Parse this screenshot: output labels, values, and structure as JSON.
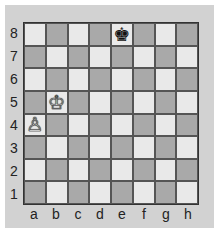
{
  "board": {
    "ranks": [
      "8",
      "7",
      "6",
      "5",
      "4",
      "3",
      "2",
      "1"
    ],
    "files": [
      "a",
      "b",
      "c",
      "d",
      "e",
      "f",
      "g",
      "h"
    ],
    "colors": {
      "light": "#e9e9e9",
      "dark": "#a9a9a9",
      "frame": "#d2d2d2"
    },
    "pieces": [
      {
        "square": "e8",
        "type": "king",
        "color": "black",
        "glyph": "♚"
      },
      {
        "square": "b5",
        "type": "king",
        "color": "white",
        "glyph": "♔"
      },
      {
        "square": "a4",
        "type": "pawn",
        "color": "white",
        "glyph": "♙"
      }
    ]
  }
}
